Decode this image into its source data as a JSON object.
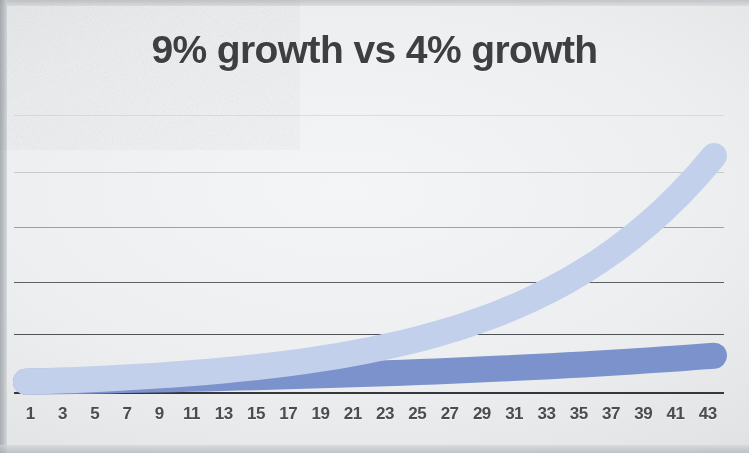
{
  "slide": {
    "background_color": "#eceeef",
    "title": "9% growth vs 4% growth"
  },
  "axis": {
    "tick_labels": [
      "1",
      "3",
      "5",
      "7",
      "9",
      "11",
      "13",
      "15",
      "17",
      "19",
      "21",
      "23",
      "25",
      "27",
      "29",
      "31",
      "33",
      "35",
      "37",
      "39",
      "41",
      "43"
    ],
    "gridline_count": 5
  },
  "chart_data": {
    "type": "area",
    "title": "9% growth vs 4% growth",
    "xlabel": "",
    "ylabel": "",
    "grid": true,
    "legend": "none",
    "x": [
      1,
      2,
      3,
      4,
      5,
      6,
      7,
      8,
      9,
      10,
      11,
      12,
      13,
      14,
      15,
      16,
      17,
      18,
      19,
      20,
      21,
      22,
      23,
      24,
      25,
      26,
      27,
      28,
      29,
      30,
      31,
      32,
      33,
      34,
      35,
      36,
      37,
      38,
      39,
      40,
      41,
      42,
      43
    ],
    "xlim": [
      1,
      43
    ],
    "ylim": [
      0,
      46
    ],
    "series": [
      {
        "name": "9% growth",
        "color": "#c3d0ec",
        "rate_percent": 9,
        "values": [
          1.0,
          1.09,
          1.19,
          1.3,
          1.41,
          1.54,
          1.68,
          1.83,
          1.99,
          2.17,
          2.37,
          2.58,
          2.81,
          3.07,
          3.34,
          3.64,
          3.97,
          4.33,
          4.72,
          5.14,
          5.6,
          6.11,
          6.66,
          7.26,
          7.91,
          8.62,
          9.4,
          10.25,
          11.17,
          12.17,
          13.27,
          14.46,
          15.76,
          17.18,
          18.73,
          20.41,
          22.25,
          24.25,
          26.44,
          28.82,
          31.41,
          34.24,
          37.32
        ]
      },
      {
        "name": "4% growth",
        "color": "#7b92cd",
        "rate_percent": 4,
        "values": [
          1.0,
          1.04,
          1.08,
          1.12,
          1.17,
          1.22,
          1.27,
          1.32,
          1.37,
          1.42,
          1.48,
          1.54,
          1.6,
          1.67,
          1.73,
          1.8,
          1.87,
          1.95,
          2.03,
          2.11,
          2.19,
          2.28,
          2.37,
          2.46,
          2.56,
          2.67,
          2.77,
          2.88,
          3.0,
          3.12,
          3.24,
          3.37,
          3.51,
          3.65,
          3.79,
          3.95,
          4.1,
          4.27,
          4.44,
          4.62,
          4.8,
          5.0,
          5.2
        ]
      }
    ],
    "annotations": []
  }
}
